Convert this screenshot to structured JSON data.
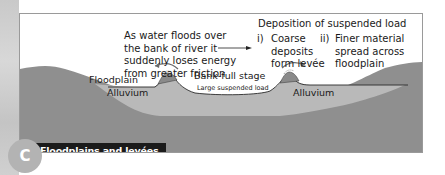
{
  "figure": {
    "title": "Floodplains and levées",
    "badge_letter": "C"
  },
  "annotations": {
    "energy_loss": [
      "As water floods over",
      "the bank of river it",
      "suddenly loses energy",
      "from greater friction"
    ],
    "deposition_heading": "Deposition of suspended load",
    "point_i_marker": "i)",
    "point_i": [
      "Coarse",
      "deposits",
      "form levée"
    ],
    "point_ii_marker": "ii)",
    "point_ii": [
      "Finer material",
      "spread across",
      "floodplain"
    ]
  },
  "labels": {
    "floodplain": "Floodplain",
    "bank_full": "Bank-full stage",
    "large_load": "Large suspended load",
    "alluvium_left": "Alluvium",
    "alluvium_right": "Alluvium"
  },
  "colors": {
    "bedrock": "#8f8f8f",
    "alluvium": "#b9b9b9",
    "levee": "#8a8a8a",
    "title_bar": "#1b1b1b",
    "badge": "#b3b3b3",
    "frame_border": "#9a9a9a"
  }
}
